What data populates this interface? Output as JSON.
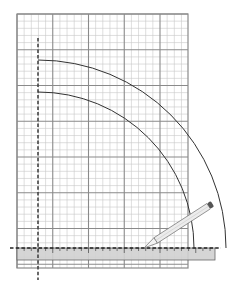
{
  "diagram": {
    "type": "geometric-construction",
    "canvas": {
      "width": 227,
      "height": 288
    },
    "grid": {
      "x0": 17,
      "y0": 14,
      "x1": 188,
      "y1": 268,
      "minor_step": 7.15,
      "major_every": 5,
      "minor_color": "#c8c8c8",
      "major_color": "#8a8a8a",
      "border_color": "#8a8a8a"
    },
    "axis_vertical": {
      "x": 38,
      "y_start": 38,
      "y_end": 280,
      "style": "dashed",
      "color": "#444444"
    },
    "axis_horizontal": {
      "y": 248,
      "x_start": 10,
      "x_end": 221,
      "style": "dashed",
      "color": "#222222"
    },
    "arcs": [
      {
        "name": "outer-arc",
        "cx": 38,
        "cy": 248,
        "r": 188,
        "color": "#333333"
      },
      {
        "name": "inner-arc",
        "cx": 38,
        "cy": 248,
        "r": 156,
        "color": "#333333"
      }
    ],
    "ruler": {
      "x": 17,
      "y": 248,
      "width": 198,
      "height": 12,
      "fill": "#d0d0d0",
      "stroke": "#666666",
      "tick_step": 7.15
    },
    "pencil": {
      "tip_x": 144,
      "tip_y": 248,
      "end_x": 212,
      "end_y": 204,
      "body_color": "#ececec",
      "outline_color": "#777777",
      "eraser_color": "#555555"
    }
  }
}
